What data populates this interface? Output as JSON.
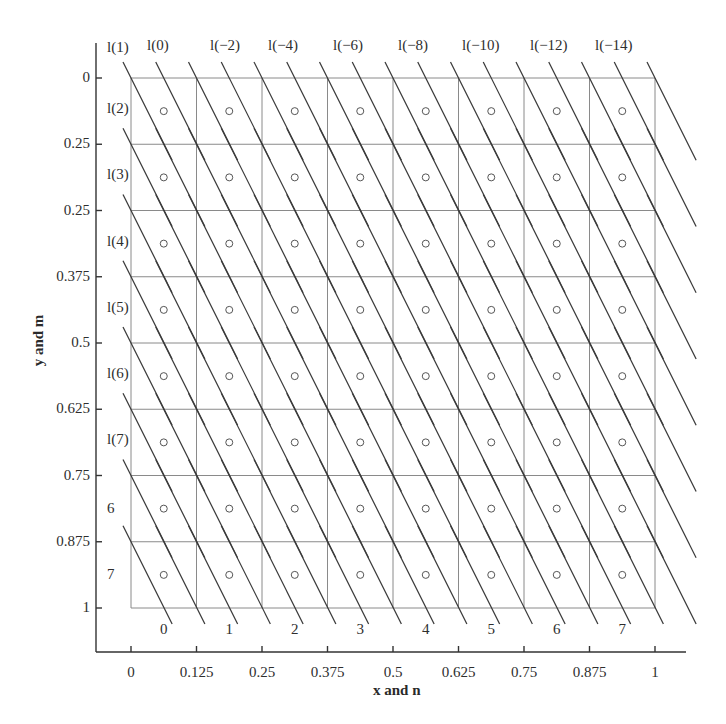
{
  "chart_data": {
    "type": "diagram",
    "title": "",
    "xlabel": "x and n",
    "ylabel": "y and m",
    "x_ticks": [
      "0",
      "0.125",
      "0.25",
      "0.375",
      "0.5",
      "0.625",
      "0.75",
      "0.875",
      "1"
    ],
    "y_ticks": [
      "0",
      "0.25",
      "0.25",
      "0.375",
      "0.5",
      "0.625",
      "0.75",
      "0.875",
      "1"
    ],
    "grid": {
      "columns": 8,
      "rows": 8,
      "xlim": [
        0,
        1
      ],
      "ylim": [
        0,
        1
      ],
      "y_inverted": true
    },
    "column_index_labels": [
      "0",
      "1",
      "2",
      "3",
      "4",
      "5",
      "6",
      "7"
    ],
    "row_labels": [
      "",
      "l(2)",
      "l(3)",
      "l(4)",
      "l(5)",
      "l(6)",
      "l(7)",
      "6",
      "7"
    ],
    "top_line_labels": [
      "l(1)",
      "l(0)",
      "l(−2)",
      "l(−4)",
      "l(−6)",
      "l(−8)",
      "l(−10)",
      "l(−12)",
      "l(−14)"
    ],
    "markers": {
      "shape": "circle-open",
      "position": "center of each cell",
      "count": 64
    },
    "diagonal_lines": {
      "slope_dy_dx_pixels": 2.0,
      "description": "parallel lines sloping down-right through grid intersections, drawn per row"
    }
  },
  "labels": {
    "xlabel": "x and n",
    "ylabel": "y and m",
    "top": [
      "l(1)",
      "l(0)",
      "l(−2)",
      "l(−4)",
      "l(−6)",
      "l(−8)",
      "l(−10)",
      "l(−12)",
      "l(−14)"
    ],
    "left": [
      "l(2)",
      "l(3)",
      "l(4)",
      "l(5)",
      "l(6)",
      "l(7)",
      "6",
      "7"
    ],
    "bottom": [
      "0",
      "1",
      "2",
      "3",
      "4",
      "5",
      "6",
      "7"
    ],
    "xticks": [
      "0",
      "0.125",
      "0.25",
      "0.375",
      "0.5",
      "0.625",
      "0.75",
      "0.875",
      "1"
    ],
    "yticks": [
      "0",
      "0.25",
      "0.25",
      "0.375",
      "0.5",
      "0.625",
      "0.75",
      "0.875",
      "1"
    ]
  }
}
